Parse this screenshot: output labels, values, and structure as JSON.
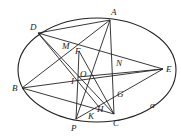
{
  "figure": {
    "ellipse": {
      "cx": 97,
      "cy": 70,
      "rx": 79,
      "ry": 52,
      "label": "α"
    },
    "points": [
      {
        "name": "D",
        "x": 38,
        "y": 33,
        "lx": 30,
        "ly": 30
      },
      {
        "name": "A",
        "x": 110,
        "y": 20,
        "lx": 111,
        "ly": 15
      },
      {
        "name": "E",
        "x": 163,
        "y": 69,
        "lx": 166,
        "ly": 72
      },
      {
        "name": "B",
        "x": 22,
        "y": 88,
        "lx": 12,
        "ly": 91
      },
      {
        "name": "P",
        "x": 76,
        "y": 119,
        "lx": 71,
        "ly": 131
      },
      {
        "name": "C",
        "x": 114,
        "y": 114,
        "lx": 113,
        "ly": 126
      },
      {
        "name": "M",
        "x": 70,
        "y": 48,
        "lx": 62,
        "ly": 49
      },
      {
        "name": "F",
        "x": 79,
        "y": 51,
        "lx": 75,
        "ly": 54
      },
      {
        "name": "O",
        "x": 80,
        "y": 72,
        "lx": 80,
        "ly": 77
      },
      {
        "name": "I",
        "x": 78,
        "y": 77,
        "lx": 71,
        "ly": 84
      },
      {
        "name": "N",
        "x": 113,
        "y": 63,
        "lx": 116,
        "ly": 66
      },
      {
        "name": "G",
        "x": 114,
        "y": 96,
        "lx": 117,
        "ly": 97
      },
      {
        "name": "H",
        "x": 99,
        "y": 107,
        "lx": 97,
        "ly": 112
      },
      {
        "name": "K",
        "x": 92,
        "y": 111,
        "lx": 88,
        "ly": 119
      }
    ],
    "ellipse_label": {
      "text": "α",
      "x": 150,
      "y": 108
    },
    "segments": [
      [
        "D",
        "A"
      ],
      [
        "D",
        "E"
      ],
      [
        "D",
        "C"
      ],
      [
        "D",
        "H"
      ],
      [
        "A",
        "P"
      ],
      [
        "A",
        "C"
      ],
      [
        "B",
        "E"
      ],
      [
        "B",
        "C"
      ],
      [
        "B",
        "A"
      ],
      [
        "E",
        "P"
      ],
      [
        "P",
        "I"
      ],
      [
        "F",
        "C"
      ],
      [
        "F",
        "I"
      ],
      [
        "I",
        "E"
      ]
    ]
  }
}
